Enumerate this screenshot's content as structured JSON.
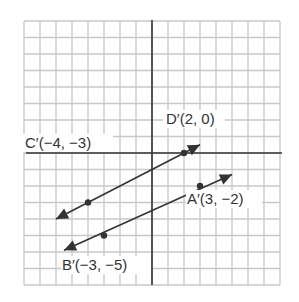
{
  "graph": {
    "grid": {
      "xmin": -8,
      "xmax": 8,
      "ymin": -8,
      "ymax": 8,
      "cell_w": 16,
      "cell_h": 16.5,
      "origin_px": [
        152,
        153
      ]
    },
    "colors": {
      "grid": "#c8c8c8",
      "axis": "#333333",
      "line": "#333333",
      "label": "#333333"
    },
    "lines": [
      {
        "name": "line-C-D",
        "from": "C",
        "to": "D",
        "arrow_start": [
          -6,
          -4
        ],
        "arrow_end": [
          3,
          0.5
        ]
      },
      {
        "name": "line-B-A",
        "from": "B",
        "to": "A",
        "arrow_start": [
          -5.5,
          -5.9
        ],
        "arrow_end": [
          5,
          -1.3
        ]
      }
    ],
    "points": [
      {
        "id": "D",
        "label": "D′(2, 0)",
        "x": 2,
        "y": 0
      },
      {
        "id": "A",
        "label": "A′(3, −2)",
        "x": 3,
        "y": -2
      },
      {
        "id": "C",
        "label": "C′(−4, −3)",
        "x": -4,
        "y": -3
      },
      {
        "id": "B",
        "label": "B′(−3, −5)",
        "x": -3,
        "y": -5
      }
    ],
    "labels": {
      "D": "D′(2, 0)",
      "A": "A′(3, −2)",
      "C": "C′(−4, −3)",
      "B": "B′(−3, −5)"
    }
  }
}
